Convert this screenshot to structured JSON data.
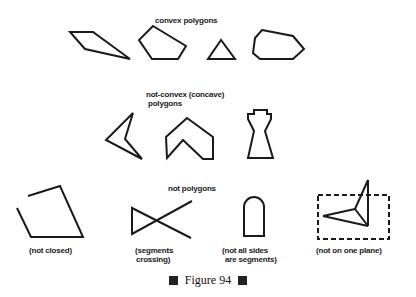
{
  "sections": {
    "convex": {
      "title": "convex polygons"
    },
    "concave": {
      "title_line1": "not-convex (concave)",
      "title_line2": "polygons"
    },
    "not_polygons": {
      "title": "not polygons",
      "captions": {
        "not_closed": "(not closed)",
        "crossing_line1": "(segments",
        "crossing_line2": "crossing)",
        "not_segments_line1": "(not all sides",
        "not_segments_line2": "are segments)",
        "not_plane": "(not on one plane)"
      }
    }
  },
  "figure_caption": "Figure 94"
}
